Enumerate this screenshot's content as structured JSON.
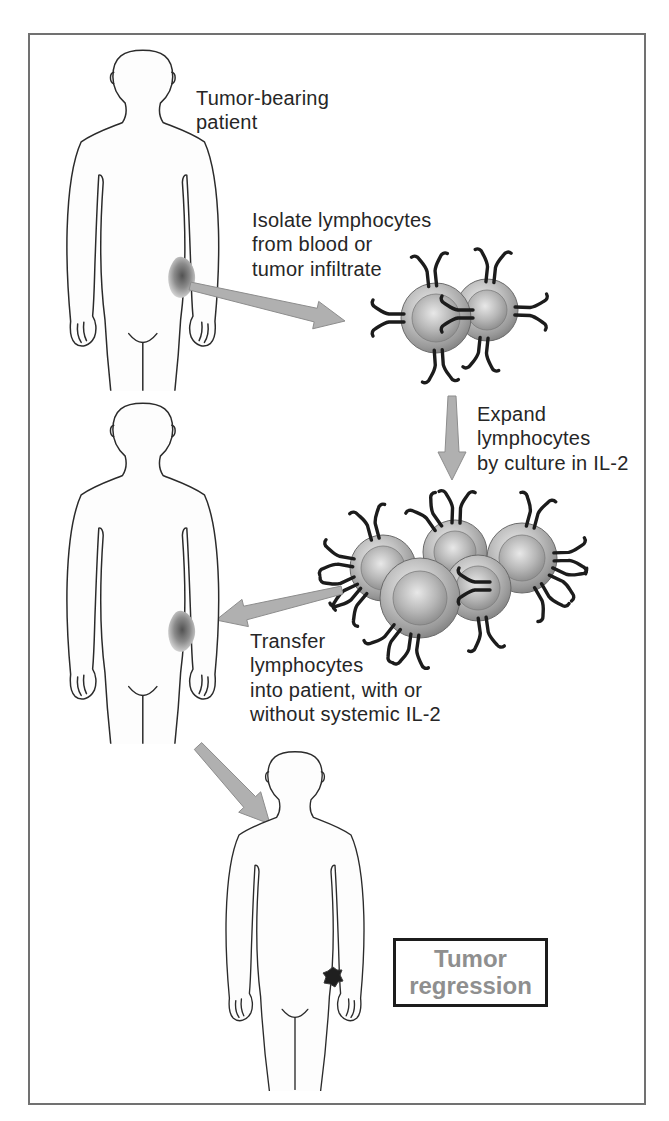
{
  "diagram": {
    "labels": {
      "patient": "Tumor-bearing\npatient",
      "isolate": "Isolate lymphocytes\nfrom blood or\ntumor infiltrate",
      "expand": "Expand\nlymphocytes\nby culture in IL-2",
      "transfer": "Transfer\nlymphocytes\ninto patient, with or\nwithout systemic IL-2",
      "outcome": "Tumor\nregression"
    },
    "colors": {
      "background": "#ffffff",
      "frame_border": "#717171",
      "body_outline": "#2b2b2b",
      "arrow_fill": "#b0b0b0",
      "cell_membrane": "#7b7b7b",
      "receptor": "#1c1c1c",
      "tumor_dark": "#5a5a5a",
      "regressed_tumor": "#1f1f1f",
      "outcome_box_border": "#1c1c1c",
      "outcome_text": "#8f8f8f",
      "label_text": "#262626"
    }
  }
}
